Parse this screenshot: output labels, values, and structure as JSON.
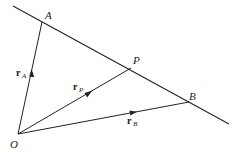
{
  "diagram": {
    "title": "",
    "points": {
      "A": {
        "label": "A"
      },
      "B": {
        "label": "B"
      },
      "P": {
        "label": "P"
      },
      "O": {
        "label": "O"
      }
    },
    "vectors": [
      {
        "name": "r_A",
        "main": "r",
        "sub": "A",
        "from": "O",
        "to": "A"
      },
      {
        "name": "r_P",
        "main": "r",
        "sub": "P",
        "from": "O",
        "to": "P"
      },
      {
        "name": "r_B",
        "main": "r",
        "sub": "B",
        "from": "O",
        "to": "B"
      }
    ],
    "line": {
      "description": "Line through A, P and B"
    },
    "colors": {
      "stroke": "#222222",
      "background": "#ffffff"
    }
  }
}
